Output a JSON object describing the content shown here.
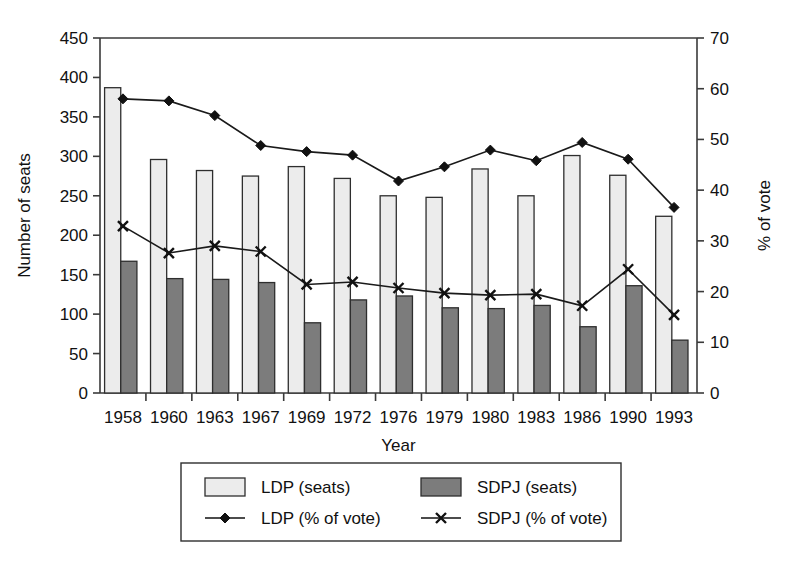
{
  "chart_data": {
    "type": "bar",
    "title": "",
    "xlabel": "Year",
    "ylabel": "Number of seats",
    "y2label": "% of vote",
    "categories": [
      "1958",
      "1960",
      "1963",
      "1967",
      "1969",
      "1972",
      "1976",
      "1979",
      "1980",
      "1983",
      "1986",
      "1990",
      "1993"
    ],
    "ylim": [
      0,
      450
    ],
    "yticks": [
      0,
      50,
      100,
      150,
      200,
      250,
      300,
      350,
      400,
      450
    ],
    "y2lim": [
      0,
      70
    ],
    "y2ticks": [
      0,
      10,
      20,
      30,
      40,
      50,
      60,
      70
    ],
    "grid": false,
    "legend_position": "bottom",
    "series": [
      {
        "name": "LDP (seats)",
        "kind": "bar",
        "axis": "left",
        "color": "#ececec",
        "values": [
          387,
          296,
          282,
          275,
          287,
          272,
          250,
          248,
          284,
          250,
          301,
          276,
          224
        ]
      },
      {
        "name": "SDPJ (seats)",
        "kind": "bar",
        "axis": "left",
        "color": "#7c7c7c",
        "values": [
          167,
          145,
          144,
          140,
          89,
          118,
          123,
          108,
          107,
          111,
          84,
          136,
          67
        ]
      },
      {
        "name": "LDP (% of vote)",
        "kind": "line",
        "axis": "right",
        "marker": "diamond",
        "color": "#111111",
        "values": [
          58.0,
          57.6,
          54.7,
          48.8,
          47.6,
          46.9,
          41.8,
          44.6,
          47.9,
          45.8,
          49.4,
          46.1,
          36.6
        ]
      },
      {
        "name": "SDPJ (% of vote)",
        "kind": "line",
        "axis": "right",
        "marker": "x",
        "color": "#111111",
        "values": [
          32.9,
          27.6,
          29.0,
          27.9,
          21.4,
          21.9,
          20.7,
          19.7,
          19.3,
          19.5,
          17.2,
          24.4,
          15.4
        ]
      }
    ]
  },
  "legend": {
    "entries": [
      {
        "label": "LDP (seats)",
        "type": "swatch",
        "color": "#ececec"
      },
      {
        "label": "SDPJ (seats)",
        "type": "swatch",
        "color": "#7c7c7c"
      },
      {
        "label": "LDP (% of vote)",
        "type": "line-diamond",
        "color": "#111111"
      },
      {
        "label": "SDPJ (% of vote)",
        "type": "line-x",
        "color": "#111111"
      }
    ]
  }
}
